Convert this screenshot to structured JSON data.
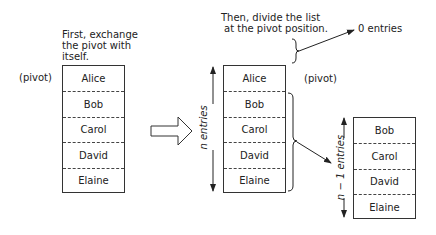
{
  "step1": {
    "caption_lines": [
      "First, exchange",
      "the pivot with",
      "itself."
    ],
    "pivot_label": "(pivot)",
    "entries": [
      "Alice",
      "Bob",
      "Carol",
      "David",
      "Elaine"
    ]
  },
  "step2": {
    "caption_lines": [
      "Then, divide the list",
      "at the pivot position."
    ],
    "pivot_label": "(pivot)",
    "entries": [
      "Alice",
      "Bob",
      "Carol",
      "David",
      "Elaine"
    ],
    "span_label": "n entries",
    "zero_label": "0 entries"
  },
  "step3": {
    "entries": [
      "Bob",
      "Carol",
      "David",
      "Elaine"
    ],
    "span_label": "n − 1 entries"
  },
  "icons": {
    "big_arrow": "hollow-right-arrow"
  }
}
